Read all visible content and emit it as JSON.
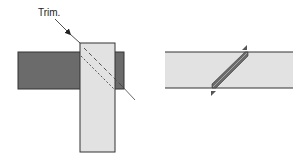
{
  "diagram": {
    "left_panel": {
      "callout_label": "Trim.",
      "dark_board_color": "#6b6b6b",
      "light_board_color": "#e2e2e2",
      "outline_color": "#333333"
    },
    "right_panel": {
      "board_color": "#e2e2e2",
      "joint_color": "#6b6b6b",
      "marker_color": "#555555"
    }
  }
}
